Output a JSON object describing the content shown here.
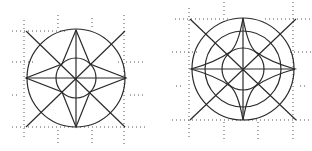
{
  "figure": {
    "description": "Two geometric compass-star constructions inscribed in circles over dotted construction grids",
    "stroke_color": "#2a2a2a",
    "grid_color": "#555555",
    "background": "#ffffff",
    "figures": [
      {
        "name": "left-compass-star",
        "center": [
          76,
          78
        ],
        "outer_radius": 49,
        "inner_radius": 20,
        "star_points": 4,
        "diagonals": 2
      },
      {
        "name": "right-compass-star",
        "center": [
          243,
          69
        ],
        "outer_radius": 52,
        "middle_radius": 38,
        "inner_radius": 22,
        "star_points": 4,
        "diagonals": 2
      }
    ]
  }
}
